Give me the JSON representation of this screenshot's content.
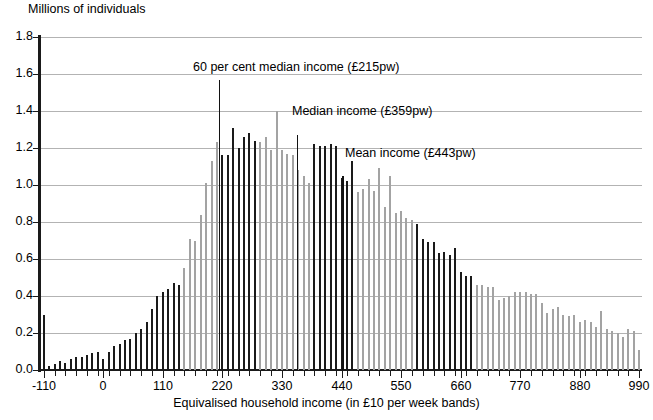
{
  "chart_data": {
    "type": "bar",
    "title": "",
    "ylabel": "Millions of individuals",
    "xlabel": "Equivalised household income (in £10 per week bands)",
    "ylim": [
      0,
      1.8
    ],
    "ytick_labels": [
      "0.0",
      "0.2",
      "0.4",
      "0.6",
      "0.8",
      "1.0",
      "1.2",
      "1.4",
      "1.6",
      "1.8"
    ],
    "ytick_values": [
      0.0,
      0.2,
      0.4,
      0.6,
      0.8,
      1.0,
      1.2,
      1.4,
      1.6,
      1.8
    ],
    "xtick_labels": [
      "-110",
      "0",
      "110",
      "220",
      "330",
      "440",
      "550",
      "660",
      "770",
      "880",
      "990"
    ],
    "xtick_values": [
      -110,
      0,
      110,
      220,
      330,
      440,
      550,
      660,
      770,
      880,
      990
    ],
    "xlim": [
      -115,
      995
    ],
    "band_width": 10,
    "grid": true,
    "legend": "none",
    "series_colors": {
      "light": "#a3a3a3",
      "dark": "#1a1a1a"
    },
    "x": [
      -110,
      -100,
      -90,
      -80,
      -70,
      -60,
      -50,
      -40,
      -30,
      -20,
      -10,
      0,
      10,
      20,
      30,
      40,
      50,
      60,
      70,
      80,
      90,
      100,
      110,
      120,
      130,
      140,
      150,
      160,
      170,
      180,
      190,
      200,
      210,
      220,
      230,
      240,
      250,
      260,
      270,
      280,
      290,
      300,
      310,
      320,
      330,
      340,
      350,
      360,
      370,
      380,
      390,
      400,
      410,
      420,
      430,
      440,
      450,
      460,
      470,
      480,
      490,
      500,
      510,
      520,
      530,
      540,
      550,
      560,
      570,
      580,
      590,
      600,
      610,
      620,
      630,
      640,
      650,
      660,
      670,
      680,
      690,
      700,
      710,
      720,
      730,
      740,
      750,
      760,
      770,
      780,
      790,
      800,
      810,
      820,
      830,
      840,
      850,
      860,
      870,
      880,
      890,
      900,
      910,
      920,
      930,
      940,
      950,
      960,
      970,
      980,
      990
    ],
    "values": [
      0.3,
      0.02,
      0.03,
      0.05,
      0.04,
      0.06,
      0.07,
      0.07,
      0.08,
      0.09,
      0.1,
      0.06,
      0.1,
      0.13,
      0.14,
      0.16,
      0.17,
      0.2,
      0.22,
      0.26,
      0.33,
      0.4,
      0.42,
      0.44,
      0.47,
      0.46,
      0.55,
      0.71,
      0.7,
      0.84,
      1.01,
      1.13,
      1.23,
      1.16,
      1.16,
      1.31,
      1.2,
      1.26,
      1.28,
      1.24,
      1.23,
      1.26,
      1.19,
      1.4,
      1.19,
      1.17,
      1.16,
      1.08,
      1.05,
      1.01,
      1.22,
      1.21,
      1.21,
      1.22,
      1.21,
      1.04,
      1.02,
      1.13,
      0.96,
      0.98,
      1.03,
      0.97,
      1.09,
      0.88,
      1.05,
      0.85,
      0.86,
      0.82,
      0.81,
      0.79,
      0.71,
      0.69,
      0.69,
      0.63,
      0.64,
      0.62,
      0.66,
      0.53,
      0.51,
      0.51,
      0.46,
      0.46,
      0.45,
      0.45,
      0.38,
      0.39,
      0.4,
      0.42,
      0.42,
      0.42,
      0.41,
      0.41,
      0.36,
      0.31,
      0.33,
      0.34,
      0.3,
      0.29,
      0.3,
      0.26,
      0.27,
      0.26,
      0.23,
      0.32,
      0.22,
      0.21,
      0.2,
      0.18,
      0.22,
      0.21,
      0.11
    ],
    "bar_colors": [
      "dark",
      "dark",
      "dark",
      "dark",
      "dark",
      "dark",
      "dark",
      "dark",
      "dark",
      "dark",
      "dark",
      "dark",
      "dark",
      "dark",
      "dark",
      "dark",
      "dark",
      "dark",
      "dark",
      "dark",
      "dark",
      "dark",
      "dark",
      "dark",
      "dark",
      "dark",
      "gray",
      "gray",
      "gray",
      "gray",
      "gray",
      "gray",
      "gray",
      "dark",
      "dark",
      "dark",
      "dark",
      "dark",
      "dark",
      "dark",
      "gray",
      "gray",
      "gray",
      "gray",
      "gray",
      "gray",
      "gray",
      "gray",
      "gray",
      "gray",
      "dark",
      "dark",
      "dark",
      "dark",
      "dark",
      "dark",
      "dark",
      "dark",
      "gray",
      "gray",
      "gray",
      "gray",
      "gray",
      "gray",
      "gray",
      "gray",
      "gray",
      "gray",
      "gray",
      "dark",
      "dark",
      "dark",
      "dark",
      "dark",
      "dark",
      "dark",
      "dark",
      "dark",
      "dark",
      "dark",
      "gray",
      "gray",
      "gray",
      "gray",
      "gray",
      "gray",
      "gray",
      "gray",
      "gray",
      "gray",
      "gray",
      "gray",
      "gray",
      "gray",
      "gray",
      "gray",
      "gray",
      "gray",
      "gray",
      "gray",
      "gray",
      "gray",
      "gray",
      "gray",
      "gray",
      "gray",
      "gray",
      "gray",
      "gray",
      "gray",
      "gray"
    ],
    "markers": [
      {
        "name": "60 per cent median income",
        "label": "60 per cent median income (£215pw)",
        "x": 215,
        "height": 1.57
      },
      {
        "name": "Median income",
        "label": "Median income (£359pw)",
        "x": 359,
        "height": 1.27
      },
      {
        "name": "Mean income",
        "label": "Mean income (£443pw)",
        "x": 443,
        "height": 1.05
      }
    ],
    "annotations": [
      {
        "text": "60 per cent median income (£215pw)",
        "x": 193,
        "y": 60
      },
      {
        "text": "Median income (£359pw)",
        "x": 292,
        "y": 104
      },
      {
        "text": "Mean income (£443pw)",
        "x": 345,
        "y": 146
      }
    ]
  }
}
